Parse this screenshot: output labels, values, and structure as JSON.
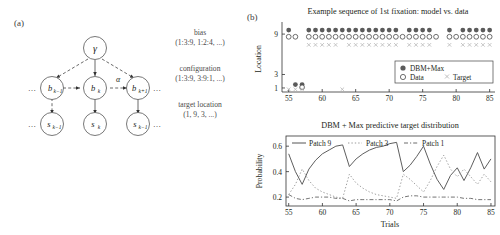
{
  "panels": {
    "a": {
      "label": "(a)"
    },
    "b": {
      "label": "(b)"
    }
  },
  "graphical_model": {
    "nodes": {
      "gamma": "γ",
      "alpha": "α",
      "b_prev": "b",
      "b_prev_sub": "k−1",
      "b_cur": "b",
      "b_cur_sub": "k",
      "b_next": "b",
      "b_next_sub": "k+1",
      "s_prev": "s",
      "s_prev_sub": "k−1",
      "s_cur": "s",
      "s_cur_sub": "k",
      "s_next": "s",
      "s_next_sub": "k−1"
    },
    "ellipsis_left": "…",
    "ellipsis_right": "…",
    "annotations": {
      "bias_title": "bias",
      "bias_values": "(1:3:9, 1:2:4, ...)",
      "config_title": "configuration",
      "config_values": "(1:3:9, 3:9:1, ...)",
      "target_title": "target location",
      "target_values": "(1, 9, 3, ...)"
    }
  },
  "chart_data": [
    {
      "id": "top",
      "type": "scatter",
      "title": "Example sequence of 1st fixation: model vs. data",
      "xlabel": "",
      "ylabel": "Location",
      "xlim": [
        54,
        85.8
      ],
      "ylim": [
        0.4,
        10.2
      ],
      "xticks": [
        55,
        60,
        65,
        70,
        75,
        80,
        85
      ],
      "yticks": [
        1,
        3,
        9
      ],
      "ytick_labels": [
        "1",
        "3",
        "9"
      ],
      "grid": false,
      "legend_position": "lower-right",
      "legend": [
        {
          "name": "DBM+Max",
          "marker": "filled-circle",
          "color": "#5b5b5b"
        },
        {
          "name": "Data",
          "marker": "open-circle",
          "color": "#4a4a4a"
        },
        {
          "name": "Target",
          "marker": "cross",
          "color": "#b5b5b5"
        }
      ],
      "series": [
        {
          "name": "DBM+Max",
          "marker": "filled-circle",
          "x": [
            55,
            56,
            57,
            58,
            59,
            60,
            61,
            62,
            63,
            64,
            65,
            66,
            67,
            68,
            69,
            70,
            71,
            72,
            73,
            74,
            75,
            76,
            77,
            78,
            79,
            80,
            81,
            82,
            83,
            84,
            85
          ],
          "y": [
            9.6,
            1.5,
            1.5,
            9.6,
            9.6,
            9.6,
            9.6,
            9.6,
            9.6,
            9.6,
            9.6,
            9.6,
            9.6,
            9.6,
            9.6,
            9.6,
            9.6,
            3.6,
            9.6,
            9.6,
            9.6,
            9.6,
            3.6,
            3.6,
            9.6,
            3.6,
            9.6,
            9.6,
            9.6,
            9.6,
            9.6
          ]
        },
        {
          "name": "Data",
          "marker": "open-circle",
          "x": [
            55,
            56,
            57,
            58,
            59,
            60,
            61,
            62,
            63,
            64,
            65,
            66,
            67,
            68,
            69,
            70,
            71,
            72,
            73,
            74,
            75,
            76,
            77,
            78,
            79,
            80,
            81,
            82,
            83,
            84,
            85
          ],
          "y": [
            8.6,
            8.6,
            1.1,
            8.6,
            8.6,
            8.6,
            8.6,
            8.6,
            8.6,
            8.6,
            8.6,
            8.6,
            8.6,
            8.6,
            8.6,
            8.6,
            8.6,
            8.6,
            8.6,
            8.6,
            8.6,
            8.6,
            8.6,
            2.9,
            8.6,
            8.6,
            8.6,
            8.6,
            8.6,
            8.6,
            8.6
          ]
        },
        {
          "name": "Target",
          "marker": "cross",
          "x": [
            55,
            56,
            57,
            58,
            59,
            60,
            61,
            62,
            63,
            64,
            65,
            66,
            67,
            68,
            69,
            70,
            71,
            72,
            73,
            74,
            75,
            76,
            77,
            78,
            79,
            80,
            81,
            82,
            83,
            84,
            85
          ],
          "y": [
            0.8,
            0.8,
            0.8,
            7.4,
            7.4,
            7.4,
            7.4,
            7.4,
            0.8,
            7.4,
            7.4,
            7.4,
            7.4,
            7.4,
            7.4,
            7.4,
            7.4,
            2.4,
            7.4,
            7.4,
            7.4,
            7.4,
            3.0,
            3.0,
            7.4,
            3.0,
            7.4,
            7.4,
            7.4,
            7.4,
            7.4
          ]
        }
      ]
    },
    {
      "id": "bottom",
      "type": "line",
      "title": "DBM + Max predictive target distribution",
      "xlabel": "Trials",
      "ylabel": "Probability",
      "xlim": [
        54.6,
        85.6
      ],
      "ylim": [
        0.13,
        0.68
      ],
      "xticks": [
        55,
        60,
        65,
        70,
        75,
        80,
        85
      ],
      "yticks": [
        0.2,
        0.4,
        0.6
      ],
      "ytick_labels": [
        "0.2",
        "0.4",
        "0.6"
      ],
      "grid": false,
      "legend_position": "top-inside",
      "legend": [
        {
          "name": "Patch 9",
          "style": "solid",
          "color": "#555555"
        },
        {
          "name": "Patch 3",
          "style": "dotted",
          "color": "#9a9a9a"
        },
        {
          "name": "Patch 1",
          "style": "dashdot",
          "color": "#6d6d6d"
        }
      ],
      "x": [
        55,
        56,
        57,
        58,
        59,
        60,
        61,
        62,
        63,
        64,
        65,
        66,
        67,
        68,
        69,
        70,
        71,
        72,
        73,
        74,
        75,
        76,
        77,
        78,
        79,
        80,
        81,
        82,
        83,
        84,
        85
      ],
      "series": [
        {
          "name": "Patch 9",
          "style": "solid",
          "color": "#555555",
          "values": [
            0.54,
            0.4,
            0.3,
            0.42,
            0.49,
            0.54,
            0.57,
            0.6,
            0.61,
            0.44,
            0.5,
            0.54,
            0.57,
            0.59,
            0.6,
            0.62,
            0.63,
            0.4,
            0.45,
            0.52,
            0.6,
            0.46,
            0.34,
            0.26,
            0.37,
            0.43,
            0.33,
            0.43,
            0.55,
            0.42,
            0.5
          ]
        },
        {
          "name": "Patch 3",
          "style": "dotted",
          "color": "#9a9a9a",
          "values": [
            0.22,
            0.3,
            0.42,
            0.33,
            0.27,
            0.24,
            0.22,
            0.2,
            0.19,
            0.38,
            0.31,
            0.27,
            0.24,
            0.22,
            0.21,
            0.2,
            0.19,
            0.38,
            0.34,
            0.29,
            0.24,
            0.33,
            0.44,
            0.53,
            0.42,
            0.36,
            0.42,
            0.36,
            0.3,
            0.38,
            0.32
          ]
        },
        {
          "name": "Patch 1",
          "style": "dashdot",
          "color": "#6d6d6d",
          "values": [
            0.22,
            0.19,
            0.18,
            0.19,
            0.2,
            0.2,
            0.2,
            0.19,
            0.19,
            0.17,
            0.18,
            0.18,
            0.18,
            0.18,
            0.18,
            0.18,
            0.17,
            0.2,
            0.21,
            0.21,
            0.2,
            0.2,
            0.2,
            0.2,
            0.2,
            0.2,
            0.19,
            0.19,
            0.18,
            0.18,
            0.18
          ]
        }
      ]
    }
  ]
}
